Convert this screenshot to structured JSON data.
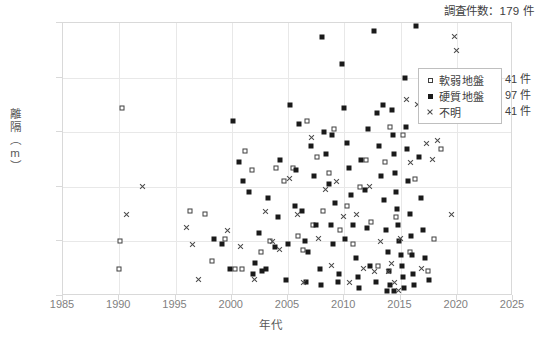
{
  "chart_data": {
    "type": "scatter",
    "title": "調査件数：179 件",
    "xlabel": "年代",
    "ylabel": "離隔（m）",
    "xlim": [
      1985,
      2025
    ],
    "ylim": [
      0,
      10
    ],
    "xticks": [
      1985,
      1990,
      1995,
      2000,
      2005,
      2010,
      2015,
      2020,
      2025
    ],
    "yticks": [
      0,
      2,
      4,
      6,
      8,
      10
    ],
    "grid": true,
    "legend_position": "top-right-inside",
    "series": [
      {
        "name": "軟弱地盤",
        "count_label": "41 件",
        "marker": "open-square",
        "color": "#3f3f3f",
        "points": [
          [
            1990.2,
            6.9
          ],
          [
            1990.0,
            1.0
          ],
          [
            1990.1,
            2.0
          ],
          [
            1996.3,
            3.1
          ],
          [
            1997.6,
            3.0
          ],
          [
            1998.2,
            1.3
          ],
          [
            1999.4,
            2.1
          ],
          [
            2000.3,
            1.0
          ],
          [
            2000.9,
            1.0
          ],
          [
            2001.2,
            5.3
          ],
          [
            2001.8,
            4.6
          ],
          [
            2002.6,
            1.6
          ],
          [
            2003.4,
            2.0
          ],
          [
            2003.9,
            4.7
          ],
          [
            2004.6,
            4.2
          ],
          [
            2005.4,
            4.7
          ],
          [
            2005.9,
            2.2
          ],
          [
            2006.3,
            1.7
          ],
          [
            2006.7,
            6.4
          ],
          [
            2007.2,
            2.6
          ],
          [
            2007.6,
            5.1
          ],
          [
            2008.1,
            3.1
          ],
          [
            2008.6,
            4.5
          ],
          [
            2009.1,
            6.1
          ],
          [
            2009.6,
            2.4
          ],
          [
            2010.2,
            3.3
          ],
          [
            2010.8,
            1.9
          ],
          [
            2011.4,
            4.0
          ],
          [
            2011.9,
            5.0
          ],
          [
            2012.4,
            2.7
          ],
          [
            2013.0,
            1.1
          ],
          [
            2013.6,
            4.9
          ],
          [
            2014.1,
            6.2
          ],
          [
            2014.6,
            2.9
          ],
          [
            2015.2,
            5.9
          ],
          [
            2015.8,
            1.6
          ],
          [
            2016.3,
            4.3
          ],
          [
            2016.9,
            6.6
          ],
          [
            2017.4,
            0.9
          ],
          [
            2018.0,
            2.1
          ],
          [
            2018.6,
            5.4
          ]
        ]
      },
      {
        "name": "硬質地盤",
        "count_label": "97 件",
        "marker": "filled-square",
        "color": "#1a1a1a",
        "points": [
          [
            1998.4,
            2.1
          ],
          [
            1999.1,
            1.9
          ],
          [
            1999.8,
            1.0
          ],
          [
            2000.1,
            6.4
          ],
          [
            2000.6,
            4.9
          ],
          [
            2001.0,
            4.2
          ],
          [
            2001.5,
            3.8
          ],
          [
            2002.1,
            1.2
          ],
          [
            2002.7,
            0.9
          ],
          [
            2003.2,
            3.6
          ],
          [
            2003.8,
            1.8
          ],
          [
            2004.3,
            5.0
          ],
          [
            2004.8,
            0.6
          ],
          [
            2005.2,
            7.0
          ],
          [
            2005.7,
            4.6
          ],
          [
            2006.0,
            6.3
          ],
          [
            2006.2,
            3.1
          ],
          [
            2006.5,
            2.0
          ],
          [
            2006.8,
            1.6
          ],
          [
            2007.0,
            5.5
          ],
          [
            2007.3,
            4.4
          ],
          [
            2007.5,
            2.6
          ],
          [
            2007.8,
            1.0
          ],
          [
            2008.0,
            9.5
          ],
          [
            2008.2,
            6.0
          ],
          [
            2008.4,
            5.2
          ],
          [
            2008.6,
            4.1
          ],
          [
            2008.8,
            2.6
          ],
          [
            2009.0,
            1.9
          ],
          [
            2009.2,
            3.4
          ],
          [
            2009.5,
            0.8
          ],
          [
            2009.8,
            8.5
          ],
          [
            2010.0,
            6.9
          ],
          [
            2010.2,
            5.6
          ],
          [
            2010.4,
            4.7
          ],
          [
            2010.6,
            3.7
          ],
          [
            2010.8,
            2.6
          ],
          [
            2011.0,
            1.4
          ],
          [
            2011.2,
            0.7
          ],
          [
            2011.5,
            5.0
          ],
          [
            2011.8,
            3.9
          ],
          [
            2012.0,
            2.5
          ],
          [
            2012.3,
            1.1
          ],
          [
            2012.6,
            9.7
          ],
          [
            2012.9,
            6.7
          ],
          [
            2013.1,
            5.5
          ],
          [
            2013.3,
            4.4
          ],
          [
            2013.5,
            3.5
          ],
          [
            2013.7,
            2.4
          ],
          [
            2013.9,
            1.6
          ],
          [
            2014.0,
            0.9
          ],
          [
            2014.1,
            0.4
          ],
          [
            2014.2,
            6.8
          ],
          [
            2014.3,
            5.9
          ],
          [
            2014.4,
            5.2
          ],
          [
            2014.5,
            4.5
          ],
          [
            2014.6,
            3.8
          ],
          [
            2014.7,
            3.2
          ],
          [
            2014.8,
            2.6
          ],
          [
            2014.9,
            2.0
          ],
          [
            2015.0,
            1.5
          ],
          [
            2015.1,
            1.1
          ],
          [
            2015.2,
            0.7
          ],
          [
            2015.3,
            0.3
          ],
          [
            2015.4,
            8.0
          ],
          [
            2015.5,
            6.2
          ],
          [
            2015.6,
            5.4
          ],
          [
            2015.7,
            4.2
          ],
          [
            2015.8,
            3.0
          ],
          [
            2015.9,
            2.2
          ],
          [
            2016.0,
            1.5
          ],
          [
            2016.1,
            0.8
          ],
          [
            2016.2,
            0.4
          ],
          [
            2016.4,
            9.9
          ],
          [
            2016.6,
            5.1
          ],
          [
            2016.8,
            3.6
          ],
          [
            2017.0,
            2.4
          ],
          [
            2017.2,
            1.4
          ],
          [
            2017.5,
            0.6
          ],
          [
            2005.0,
            1.9
          ],
          [
            2006.6,
            0.5
          ],
          [
            2007.9,
            0.4
          ],
          [
            2009.4,
            0.5
          ],
          [
            2011.3,
            0.3
          ],
          [
            2012.8,
            0.5
          ],
          [
            2013.8,
            0.2
          ],
          [
            2014.4,
            0.2
          ],
          [
            2004.1,
            2.9
          ],
          [
            2005.6,
            3.3
          ],
          [
            2008.9,
            5.9
          ],
          [
            2010.1,
            2.1
          ],
          [
            2012.1,
            6.1
          ],
          [
            2013.4,
            7.0
          ],
          [
            2003.0,
            1.0
          ],
          [
            2002.4,
            2.3
          ],
          [
            2001.9,
            0.8
          ]
        ]
      },
      {
        "name": "不明",
        "count_label": "41 件",
        "marker": "cross",
        "color": "#4a4a4a",
        "points": [
          [
            1990.6,
            3.0
          ],
          [
            1992.1,
            4.0
          ],
          [
            1996.0,
            2.5
          ],
          [
            1996.5,
            1.9
          ],
          [
            1997.0,
            0.6
          ],
          [
            1999.6,
            2.4
          ],
          [
            2000.8,
            1.8
          ],
          [
            2002.0,
            0.6
          ],
          [
            2003.0,
            3.1
          ],
          [
            2003.6,
            2.0
          ],
          [
            2004.2,
            1.7
          ],
          [
            2005.1,
            4.3
          ],
          [
            2005.8,
            3.0
          ],
          [
            2006.4,
            0.5
          ],
          [
            2007.1,
            5.8
          ],
          [
            2007.7,
            2.1
          ],
          [
            2008.3,
            3.9
          ],
          [
            2008.9,
            1.1
          ],
          [
            2009.3,
            4.2
          ],
          [
            2009.9,
            2.9
          ],
          [
            2010.5,
            0.5
          ],
          [
            2011.1,
            3.0
          ],
          [
            2011.7,
            1.0
          ],
          [
            2012.2,
            4.0
          ],
          [
            2012.7,
            0.9
          ],
          [
            2013.2,
            2.0
          ],
          [
            2013.9,
            0.9
          ],
          [
            2014.2,
            1.2
          ],
          [
            2014.5,
            0.5
          ],
          [
            2014.8,
            0.2
          ],
          [
            2015.0,
            2.1
          ],
          [
            2015.5,
            7.2
          ],
          [
            2015.9,
            4.9
          ],
          [
            2016.5,
            7.0
          ],
          [
            2016.9,
            1.0
          ],
          [
            2017.3,
            5.6
          ],
          [
            2017.8,
            5.0
          ],
          [
            2018.3,
            5.7
          ],
          [
            2019.8,
            9.5
          ],
          [
            2020.0,
            9.0
          ],
          [
            2019.5,
            3.0
          ]
        ]
      }
    ]
  }
}
